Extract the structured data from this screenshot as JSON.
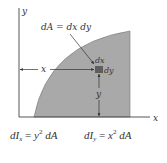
{
  "diagram": {
    "axes": {
      "x_label": "x",
      "y_label": "y"
    },
    "element_label": "dA = dx dy",
    "element_dims": {
      "width_label": "dx",
      "height_label": "dy"
    },
    "distance_labels": {
      "horizontal": "x",
      "vertical": "y"
    },
    "formulas": [
      {
        "id": "dIx",
        "lhs": "dI",
        "sub": "x",
        "rhs_var": "y",
        "power": "2",
        "rhs_tail": "dA"
      },
      {
        "id": "dIy",
        "lhs": "dI",
        "sub": "y",
        "rhs_var": "x",
        "power": "2",
        "rhs_tail": "dA"
      }
    ],
    "colors": {
      "region_fill": "#a9a9a9",
      "element_fill": "#5e5e5e",
      "axis": "#444444",
      "text": "#333333"
    }
  }
}
